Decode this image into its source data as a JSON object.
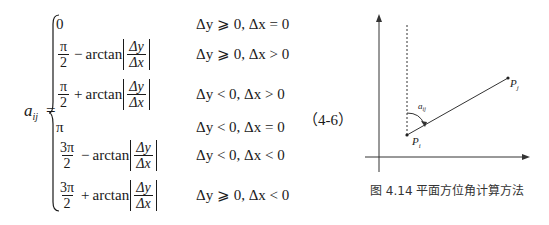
{
  "equation": {
    "lhs_var": "a",
    "lhs_sub": "ij",
    "equals": "=",
    "number": "（4-6）",
    "cases": [
      {
        "expr_type": "const",
        "value": "0",
        "condition": "Δy ⩾ 0, Δx = 0"
      },
      {
        "expr_type": "frac_arctan",
        "coef_num": "π",
        "coef_den": "2",
        "op": "−",
        "func": "arctan",
        "arg_num": "Δy",
        "arg_den": "Δx",
        "condition": "Δy ⩾ 0, Δx > 0"
      },
      {
        "expr_type": "frac_arctan",
        "coef_num": "π",
        "coef_den": "2",
        "op": "+",
        "func": "arctan",
        "arg_num": "Δy",
        "arg_den": "Δx",
        "condition": "Δy < 0, Δx > 0"
      },
      {
        "expr_type": "const",
        "value": "π",
        "condition": "Δy < 0, Δx = 0"
      },
      {
        "expr_type": "frac_arctan",
        "coef_num": "3π",
        "coef_den": "2",
        "op": "−",
        "func": "arctan",
        "arg_num": "Δy",
        "arg_den": "Δx",
        "condition": "Δy < 0, Δx < 0"
      },
      {
        "expr_type": "frac_arctan",
        "coef_num": "3π",
        "coef_den": "2",
        "op": "+",
        "func": "arctan",
        "arg_num": "Δy",
        "arg_den": "Δx",
        "condition": "Δy ⩾ 0, Δx < 0"
      }
    ]
  },
  "figure": {
    "angle_label": "a",
    "angle_sub": "ij",
    "point_i": "P",
    "point_i_sub": "i",
    "point_j": "P",
    "point_j_sub": "j",
    "caption": "图 4.14   平面方位角计算方法"
  }
}
